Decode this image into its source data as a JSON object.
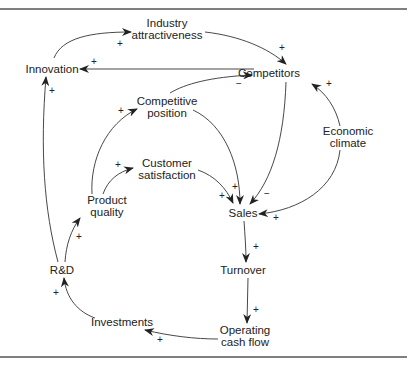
{
  "diagram": {
    "type": "causal-loop",
    "nodes": [
      {
        "id": "innovation",
        "label": "Innovation",
        "x": 52,
        "y": 69
      },
      {
        "id": "industry_attractiveness",
        "label": "Industry\nattractiveness",
        "x": 167,
        "y": 29
      },
      {
        "id": "competitors",
        "label": "Competitors",
        "x": 269,
        "y": 73
      },
      {
        "id": "competitive_position",
        "label": "Competitive\nposition",
        "x": 167,
        "y": 107
      },
      {
        "id": "customer_satisfaction",
        "label": "Customer\nsatisfaction",
        "x": 167,
        "y": 169
      },
      {
        "id": "economic_climate",
        "label": "Economic\nclimate",
        "x": 348,
        "y": 137
      },
      {
        "id": "product_quality",
        "label": "Product\nquality",
        "x": 107,
        "y": 206
      },
      {
        "id": "sales",
        "label": "Sales",
        "x": 243,
        "y": 213
      },
      {
        "id": "rd",
        "label": "R&D",
        "x": 62,
        "y": 270
      },
      {
        "id": "turnover",
        "label": "Turnover",
        "x": 243,
        "y": 270
      },
      {
        "id": "investments",
        "label": "Investments",
        "x": 122,
        "y": 322
      },
      {
        "id": "operating_cash_flow",
        "label": "Operating\ncash flow",
        "x": 245,
        "y": 336
      }
    ],
    "edges": [
      {
        "from": "innovation",
        "to": "industry_attractiveness",
        "polarity": "+",
        "sign_x": 120,
        "sign_y": 44
      },
      {
        "from": "industry_attractiveness",
        "to": "competitors",
        "polarity": "+",
        "sign_x": 282,
        "sign_y": 48
      },
      {
        "from": "competitors",
        "to": "innovation",
        "polarity": "+",
        "sign_x": 94,
        "sign_y": 62
      },
      {
        "from": "competitive_position",
        "to": "competitors",
        "polarity": "−",
        "sign_x": 239,
        "sign_y": 84
      },
      {
        "from": "economic_climate",
        "to": "competitors",
        "polarity": "+",
        "sign_x": 329,
        "sign_y": 84
      },
      {
        "from": "product_quality",
        "to": "competitive_position",
        "polarity": "+",
        "sign_x": 121,
        "sign_y": 111
      },
      {
        "from": "product_quality",
        "to": "customer_satisfaction",
        "polarity": "+",
        "sign_x": 118,
        "sign_y": 165
      },
      {
        "from": "competitive_position",
        "to": "sales",
        "polarity": "+",
        "sign_x": 235,
        "sign_y": 187
      },
      {
        "from": "customer_satisfaction",
        "to": "sales",
        "polarity": "+",
        "sign_x": 222,
        "sign_y": 196
      },
      {
        "from": "competitors",
        "to": "sales",
        "polarity": "−",
        "sign_x": 267,
        "sign_y": 194
      },
      {
        "from": "economic_climate",
        "to": "sales",
        "polarity": "+",
        "sign_x": 276,
        "sign_y": 218
      },
      {
        "from": "sales",
        "to": "turnover",
        "polarity": "+",
        "sign_x": 256,
        "sign_y": 247
      },
      {
        "from": "turnover",
        "to": "operating_cash_flow",
        "polarity": "+",
        "sign_x": 256,
        "sign_y": 310
      },
      {
        "from": "operating_cash_flow",
        "to": "investments",
        "polarity": "+",
        "sign_x": 160,
        "sign_y": 340
      },
      {
        "from": "investments",
        "to": "rd",
        "polarity": "+",
        "sign_x": 56,
        "sign_y": 293
      },
      {
        "from": "rd",
        "to": "product_quality",
        "polarity": "+",
        "sign_x": 79,
        "sign_y": 237
      },
      {
        "from": "rd",
        "to": "innovation",
        "polarity": "+",
        "sign_x": 52,
        "sign_y": 91
      }
    ]
  }
}
